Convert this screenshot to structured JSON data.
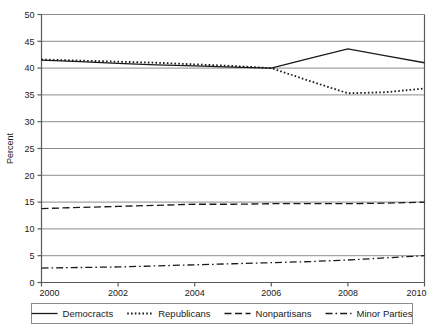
{
  "chart_data": {
    "type": "line",
    "title": "",
    "subtitle": "",
    "xlabel": "",
    "ylabel": "Percent",
    "xlim": [
      2000,
      2010
    ],
    "ylim": [
      0,
      50
    ],
    "ytick_step": 5,
    "xtick_step": 2,
    "grid": true,
    "grid_axis": "y",
    "legend_position": "bottom",
    "xticks": [
      "2000",
      "2002",
      "2004",
      "2006",
      "2008",
      "2010"
    ],
    "yticks": [
      "0",
      "5",
      "10",
      "15",
      "20",
      "25",
      "30",
      "35",
      "40",
      "45",
      "50"
    ],
    "x": [
      2000,
      2001,
      2002,
      2003,
      2004,
      2005,
      2006,
      2007,
      2008,
      2009,
      2010
    ],
    "series": [
      {
        "name": "Democracts",
        "style": "solid",
        "color": "#1a1a1a",
        "values": [
          41.5,
          41.2,
          40.9,
          40.6,
          40.4,
          40.2,
          40.0,
          41.8,
          43.6,
          42.3,
          41.0
        ]
      },
      {
        "name": "Republicans",
        "style": "dotted",
        "color": "#1a1a1a",
        "values": [
          41.6,
          41.4,
          41.2,
          41.0,
          40.7,
          40.4,
          40.0,
          37.6,
          35.3,
          35.5,
          36.2
        ]
      },
      {
        "name": "Nonpartisans",
        "style": "dashed",
        "color": "#1a1a1a",
        "values": [
          13.8,
          14.0,
          14.2,
          14.4,
          14.6,
          14.6,
          14.7,
          14.7,
          14.7,
          14.8,
          15.0
        ]
      },
      {
        "name": "Minor Parties",
        "style": "dashdot",
        "color": "#1a1a1a",
        "values": [
          2.7,
          2.8,
          2.9,
          3.1,
          3.3,
          3.5,
          3.7,
          3.9,
          4.2,
          4.6,
          5.0
        ]
      }
    ]
  },
  "axes": {
    "ylabel": "Percent",
    "yticks": [
      "50",
      "45",
      "40",
      "35",
      "30",
      "25",
      "20",
      "15",
      "10",
      "5",
      "0"
    ],
    "xticks": [
      "2000",
      "2002",
      "2004",
      "2006",
      "2008",
      "2010"
    ]
  },
  "legend": {
    "items": [
      {
        "label": "Democracts",
        "style": "solid"
      },
      {
        "label": "Republicans",
        "style": "dotted"
      },
      {
        "label": "Nonpartisans",
        "style": "dashed"
      },
      {
        "label": "Minor Parties",
        "style": "dashdot"
      }
    ]
  },
  "colors": {
    "ink": "#1a1a1a",
    "gridline": "#8c8c8c",
    "frame": "#5a5a5a",
    "legend_border": "#8c8c8c",
    "background": "#ffffff"
  },
  "caption": {
    "text": ""
  }
}
